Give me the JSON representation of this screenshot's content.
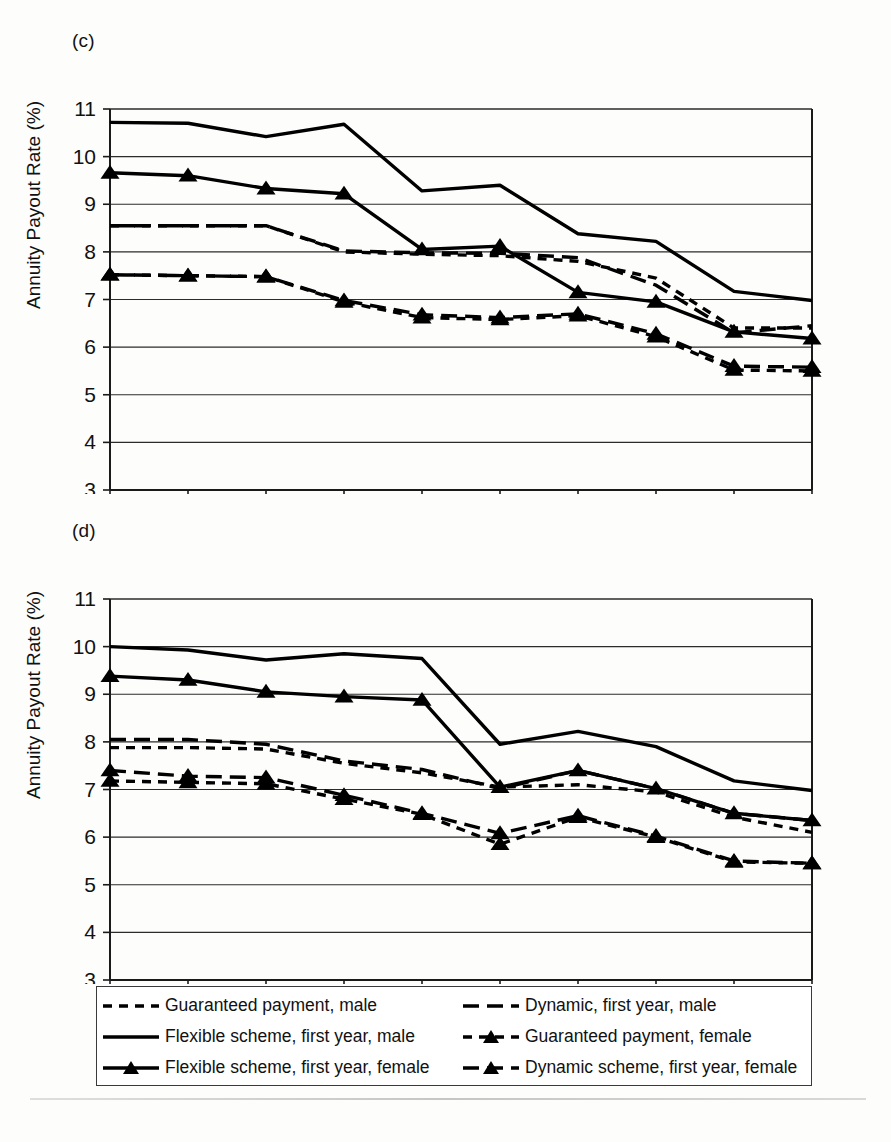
{
  "figure": {
    "panels": [
      {
        "letter": "(c)",
        "id": "c"
      },
      {
        "letter": "(d)",
        "id": "d"
      }
    ],
    "ylabel": "Annuity Payout Rate (%)",
    "caption": ""
  },
  "legend": {
    "items": [
      {
        "label": "Guaranteed payment, male",
        "key": "dashed-short-line",
        "col": 0,
        "row": 0
      },
      {
        "label": "Dynamic, first year, male",
        "key": "dashed-long-line",
        "col": 1,
        "row": 0
      },
      {
        "label": "Flexible scheme, first year, male",
        "key": "solid-line",
        "col": 0,
        "row": 1
      },
      {
        "label": "Guaranteed payment, female",
        "key": "dashed-short-line-triangle",
        "col": 1,
        "row": 1
      },
      {
        "label": "Flexible scheme, first year, female",
        "key": "solid-line-triangle",
        "col": 0,
        "row": 2
      },
      {
        "label": "Dynamic scheme, first year, female",
        "key": "dashed-long-line-triangle",
        "col": 1,
        "row": 2
      }
    ]
  },
  "chart_data": [
    {
      "type": "line",
      "id": "c",
      "title": "(c)",
      "xlabel": "",
      "ylabel": "Annuity Payout Rate (%)",
      "categories": [
        "1997",
        "1998",
        "1999",
        "2000",
        "2001",
        "2002",
        "2003",
        "2004",
        "2005",
        "2006"
      ],
      "x": [
        1997,
        1998,
        1999,
        2000,
        2001,
        2002,
        2003,
        2004,
        2005,
        2006
      ],
      "ylim": [
        3,
        11
      ],
      "yticks": [
        3,
        4,
        5,
        6,
        7,
        8,
        9,
        10,
        11
      ],
      "grid": true,
      "legend_position": "below-figure",
      "series": [
        {
          "name": "Guaranteed payment, male",
          "style": "dashed-short",
          "marker": "none",
          "values": [
            8.55,
            8.55,
            8.55,
            8.0,
            7.95,
            7.92,
            7.8,
            7.45,
            6.4,
            6.4
          ]
        },
        {
          "name": "Dynamic, first year, male",
          "style": "dashed-long",
          "marker": "none",
          "values": [
            8.55,
            8.55,
            8.55,
            8.02,
            7.98,
            7.97,
            7.88,
            7.3,
            6.3,
            6.45
          ]
        },
        {
          "name": "Flexible scheme, first year, male",
          "style": "solid",
          "marker": "none",
          "values": [
            10.72,
            10.7,
            10.42,
            10.68,
            9.28,
            9.4,
            8.38,
            8.22,
            7.17,
            6.98
          ]
        },
        {
          "name": "Guaranteed payment, female",
          "style": "dashed-short",
          "marker": "triangle",
          "values": [
            7.52,
            7.5,
            7.48,
            6.95,
            6.62,
            6.58,
            6.66,
            6.22,
            5.52,
            5.5
          ]
        },
        {
          "name": "Flexible scheme, first year, female",
          "style": "solid",
          "marker": "triangle",
          "values": [
            9.66,
            9.6,
            9.33,
            9.22,
            8.05,
            8.12,
            7.15,
            6.95,
            6.32,
            6.18
          ]
        },
        {
          "name": "Dynamic scheme, first year, female",
          "style": "dashed-long",
          "marker": "triangle",
          "values": [
            7.52,
            7.5,
            7.48,
            6.98,
            6.68,
            6.62,
            6.7,
            6.28,
            5.6,
            5.58
          ]
        }
      ]
    },
    {
      "type": "line",
      "id": "d",
      "title": "(d)",
      "xlabel": "",
      "ylabel": "Annuity Payout Rate (%)",
      "categories": [
        "1997",
        "1998",
        "1999",
        "2000",
        "2001",
        "2002",
        "2003",
        "2004",
        "2005",
        "2006"
      ],
      "x": [
        1997,
        1998,
        1999,
        2000,
        2001,
        2002,
        2003,
        2004,
        2005,
        2006
      ],
      "ylim": [
        3,
        11
      ],
      "yticks": [
        3,
        4,
        5,
        6,
        7,
        8,
        9,
        10,
        11
      ],
      "grid": true,
      "legend_position": "below-figure",
      "series": [
        {
          "name": "Guaranteed payment, male",
          "style": "dashed-short",
          "marker": "none",
          "values": [
            7.88,
            7.88,
            7.85,
            7.55,
            7.35,
            7.05,
            7.1,
            6.95,
            6.42,
            6.1
          ]
        },
        {
          "name": "Dynamic, first year, male",
          "style": "dashed-long",
          "marker": "none",
          "values": [
            8.05,
            8.05,
            7.95,
            7.6,
            7.42,
            7.02,
            7.4,
            7.02,
            6.5,
            6.35
          ]
        },
        {
          "name": "Flexible scheme, first year, male",
          "style": "solid",
          "marker": "none",
          "values": [
            10.0,
            9.93,
            9.72,
            9.85,
            9.75,
            7.95,
            8.22,
            7.9,
            7.18,
            6.98
          ]
        },
        {
          "name": "Guaranteed payment, female",
          "style": "dashed-short",
          "marker": "triangle",
          "values": [
            7.18,
            7.15,
            7.12,
            6.8,
            6.48,
            5.85,
            6.42,
            6.0,
            5.48,
            5.45
          ]
        },
        {
          "name": "Flexible scheme, first year, female",
          "style": "solid",
          "marker": "triangle",
          "values": [
            9.38,
            9.3,
            9.05,
            8.95,
            8.88,
            7.05,
            7.4,
            7.02,
            6.5,
            6.35
          ]
        },
        {
          "name": "Dynamic scheme, first year, female",
          "style": "dashed-long",
          "marker": "triangle",
          "values": [
            7.4,
            7.28,
            7.25,
            6.88,
            6.5,
            6.08,
            6.45,
            6.02,
            5.5,
            5.45
          ]
        }
      ]
    }
  ]
}
